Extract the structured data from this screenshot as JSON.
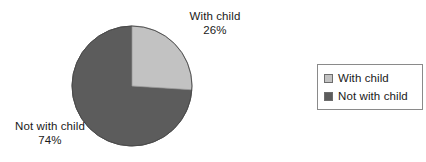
{
  "chart_data": {
    "type": "pie",
    "title": "",
    "subtitle": "",
    "xlabel": "",
    "ylabel": "",
    "grid": false,
    "legend_position": "right",
    "start_angle_deg": 0,
    "direction": "clockwise",
    "categories": [
      "With child",
      "Not with child"
    ],
    "values": [
      26,
      74
    ],
    "units": "percent",
    "slices": [
      {
        "label": "With child",
        "value": 26,
        "value_text": "26%",
        "color": "#c2c2c2",
        "edge_color": "#9a9a9a",
        "start_angle_deg": 0,
        "end_angle_deg": 93.6
      },
      {
        "label": "Not with child",
        "value": 74,
        "value_text": "74%",
        "color": "#5c5c5c",
        "edge_color": "#4a4a4a",
        "start_angle_deg": 93.6,
        "end_angle_deg": 360
      }
    ],
    "annotations": [
      {
        "name": "with-child-callout",
        "label": "With child",
        "value_text": "26%"
      },
      {
        "name": "not-with-child-callout",
        "label": "Not with child",
        "value_text": "74%"
      }
    ],
    "legend": {
      "entries": [
        {
          "label": "With child",
          "color": "#c2c2c2"
        },
        {
          "label": "Not with child",
          "color": "#5c5c5c"
        }
      ]
    }
  },
  "colors": {
    "background": "#ffffff",
    "text": "#1a1a1a",
    "with_child": "#c2c2c2",
    "not_with_child": "#5c5c5c",
    "legend_border": "#8a8a8a",
    "swatch_border": "#6d6d6d"
  }
}
